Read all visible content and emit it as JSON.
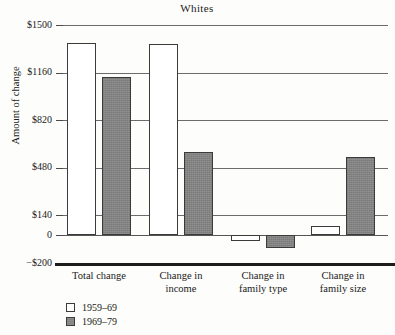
{
  "chart_data": {
    "type": "bar",
    "title": "Whites",
    "xlabel": "",
    "ylabel": "Amount of change",
    "categories": [
      "Total change",
      "Change in income",
      "Change in family type",
      "Change in family size"
    ],
    "category_lines": [
      [
        "Total change"
      ],
      [
        "Change in",
        "income"
      ],
      [
        "Change in",
        "family type"
      ],
      [
        "Change in",
        "family size"
      ]
    ],
    "series": [
      {
        "name": "1959–69",
        "color": "#ffffff",
        "values": [
          1375,
          1365,
          -45,
          65
        ]
      },
      {
        "name": "1969–79",
        "color": "#838383",
        "values": [
          1130,
          590,
          -90,
          560
        ]
      }
    ],
    "ylim": [
      -200,
      1500
    ],
    "yticks": [
      1500,
      1160,
      820,
      480,
      140,
      0,
      -200
    ],
    "ytick_labels": [
      "$1500",
      "$1160",
      "$820",
      "$480",
      "$140",
      "0",
      "−$200"
    ],
    "grid": true,
    "legend_position": "bottom-left"
  },
  "legend": {
    "entries": [
      {
        "label": "1959–69"
      },
      {
        "label": "1969–79"
      }
    ]
  }
}
